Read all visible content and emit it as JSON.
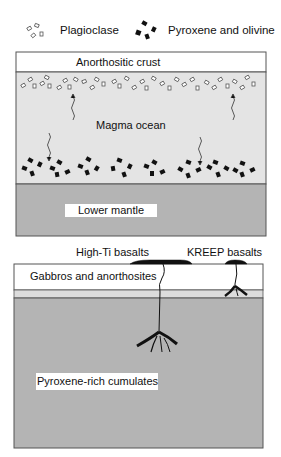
{
  "legend": {
    "plagioclase_label": "Plagioclase",
    "pyroxene_label": "Pyroxene and olivine",
    "plagioclase_icon": "hollow-crystals-icon",
    "pyroxene_icon": "solid-crystals-icon"
  },
  "top_panel": {
    "crust_label": "Anorthositic crust",
    "magma_label": "Magma ocean",
    "mantle_label": "Lower mantle"
  },
  "bottom_panel": {
    "high_ti_label": "High-Ti basalts",
    "kreep_label": "KREEP basalts",
    "gabbro_label": "Gabbros and anorthosites",
    "cumulates_label": "Pyroxene-rich cumulates"
  },
  "colors": {
    "magma": "#e4e4e4",
    "mantle": "#b4b4b4",
    "cumulates": "#b4b4b4",
    "thin_band": "#dcdcdc",
    "crystal": "#111111"
  }
}
